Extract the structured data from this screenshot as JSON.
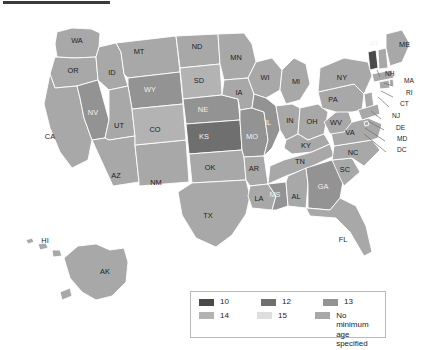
{
  "page": {
    "kind": "choropleth-map",
    "region": "United States",
    "background_color": "#ffffff",
    "top_rule_color": "#3b3b3b",
    "border_color": "#ffffff",
    "label_color": "#1d1d1d",
    "label_color_light": "#f2f2f2"
  },
  "legend": {
    "border_color": "#b9b9b9",
    "background": "#ffffff",
    "rows": [
      [
        {
          "label": "10",
          "color": "#4a4a4a"
        },
        {
          "label": "12",
          "color": "#6f6f6f"
        },
        {
          "label": "13",
          "color": "#939393"
        }
      ],
      [
        {
          "label": "14",
          "color": "#b3b3b3"
        },
        {
          "label": "15",
          "color": "#dedede"
        },
        {
          "label": "No minimum\nage specified",
          "color": "#a8a8a8"
        }
      ]
    ]
  },
  "categories": {
    "10": "#4a4a4a",
    "12": "#6f6f6f",
    "13": "#939393",
    "14": "#b3b3b3",
    "15": "#dedede",
    "none": "#a8a8a8"
  },
  "chart_data": {
    "type": "choropleth",
    "title": "",
    "value_label": "Minimum age",
    "legend_position": "bottom-center",
    "categories": [
      "10",
      "12",
      "13",
      "14",
      "15",
      "No minimum age specified"
    ],
    "states": [
      {
        "code": "WA",
        "value": "none"
      },
      {
        "code": "OR",
        "value": "none"
      },
      {
        "code": "CA",
        "value": "none"
      },
      {
        "code": "NV",
        "value": "13"
      },
      {
        "code": "ID",
        "value": "none"
      },
      {
        "code": "MT",
        "value": "none"
      },
      {
        "code": "WY",
        "value": "13"
      },
      {
        "code": "UT",
        "value": "none"
      },
      {
        "code": "AZ",
        "value": "none"
      },
      {
        "code": "NM",
        "value": "none"
      },
      {
        "code": "CO",
        "value": "14"
      },
      {
        "code": "ND",
        "value": "none"
      },
      {
        "code": "SD",
        "value": "14"
      },
      {
        "code": "NE",
        "value": "13"
      },
      {
        "code": "KS",
        "value": "12"
      },
      {
        "code": "OK",
        "value": "none"
      },
      {
        "code": "TX",
        "value": "none"
      },
      {
        "code": "MN",
        "value": "none"
      },
      {
        "code": "IA",
        "value": "none"
      },
      {
        "code": "MO",
        "value": "13"
      },
      {
        "code": "AR",
        "value": "none"
      },
      {
        "code": "LA",
        "value": "none"
      },
      {
        "code": "WI",
        "value": "none"
      },
      {
        "code": "IL",
        "value": "13"
      },
      {
        "code": "MS",
        "value": "13"
      },
      {
        "code": "MI",
        "value": "none"
      },
      {
        "code": "IN",
        "value": "none"
      },
      {
        "code": "OH",
        "value": "none"
      },
      {
        "code": "KY",
        "value": "none"
      },
      {
        "code": "TN",
        "value": "none"
      },
      {
        "code": "AL",
        "value": "none"
      },
      {
        "code": "GA",
        "value": "13"
      },
      {
        "code": "FL",
        "value": "none"
      },
      {
        "code": "SC",
        "value": "none"
      },
      {
        "code": "NC",
        "value": "none"
      },
      {
        "code": "VA",
        "value": "none"
      },
      {
        "code": "WV",
        "value": "none"
      },
      {
        "code": "PA",
        "value": "none"
      },
      {
        "code": "NY",
        "value": "none"
      },
      {
        "code": "VT",
        "value": "10"
      },
      {
        "code": "NH",
        "value": "none"
      },
      {
        "code": "ME",
        "value": "none"
      },
      {
        "code": "MA",
        "value": "none"
      },
      {
        "code": "RI",
        "value": "none"
      },
      {
        "code": "CT",
        "value": "none"
      },
      {
        "code": "NJ",
        "value": "none"
      },
      {
        "code": "DE",
        "value": "none"
      },
      {
        "code": "MD",
        "value": "none"
      },
      {
        "code": "DC",
        "value": "none"
      },
      {
        "code": "AK",
        "value": "none"
      },
      {
        "code": "HI",
        "value": "none"
      }
    ],
    "labels": {
      "WA": "WA",
      "OR": "OR",
      "CA": "CA",
      "NV": "NV",
      "ID": "ID",
      "MT": "MT",
      "WY": "WY",
      "UT": "UT",
      "AZ": "AZ",
      "NM": "NM",
      "CO": "CO",
      "ND": "ND",
      "SD": "SD",
      "NE": "NE",
      "KS": "KS",
      "OK": "OK",
      "TX": "TX",
      "MN": "MN",
      "IA": "IA",
      "MO": "MO",
      "AR": "AR",
      "LA": "LA",
      "WI": "WI",
      "IL": "IL",
      "MS": "MS",
      "MI": "MI",
      "IN": "IN",
      "OH": "OH",
      "KY": "KY",
      "TN": "TN",
      "AL": "AL",
      "GA": "GA",
      "FL": "FL",
      "SC": "SC",
      "NC": "NC",
      "VA": "VA",
      "WV": "WV",
      "PA": "PA",
      "NY": "NY",
      "VT": "VT",
      "NH": "NH",
      "ME": "ME",
      "MA": "MA",
      "RI": "RI",
      "CT": "CT",
      "NJ": "NJ",
      "DE": "DE",
      "MD": "MD",
      "DC": "DC",
      "AK": "AK",
      "HI": "HI"
    }
  }
}
